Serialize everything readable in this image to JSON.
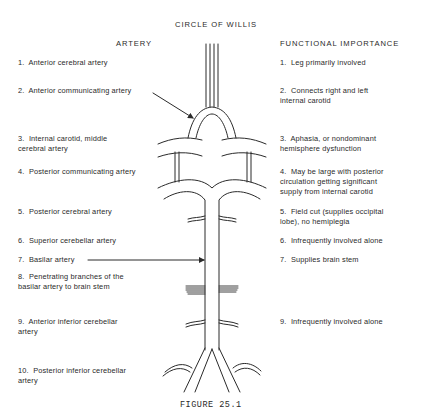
{
  "title": "CIRCLE OF WILLIS",
  "columns": {
    "left": "ARTERY",
    "right": "FUNCTIONAL IMPORTANCE"
  },
  "arteries": [
    {
      "n": "1.",
      "lines": [
        "Anterior cerebral artery"
      ]
    },
    {
      "n": "2.",
      "lines": [
        "Anterior communicating artery"
      ]
    },
    {
      "n": "3.",
      "lines": [
        "Internal carotid, middle",
        "cerebral artery"
      ]
    },
    {
      "n": "4.",
      "lines": [
        "Posterior communicating artery"
      ]
    },
    {
      "n": "5.",
      "lines": [
        "Posterior cerebral artery"
      ]
    },
    {
      "n": "6.",
      "lines": [
        "Superior cerebellar artery"
      ]
    },
    {
      "n": "7.",
      "lines": [
        "Basilar artery"
      ]
    },
    {
      "n": "8.",
      "lines": [
        "Penetrating branches of the",
        "basilar artery to brain stem"
      ]
    },
    {
      "n": "9.",
      "lines": [
        "Anterior inferior cerebellar",
        "artery"
      ]
    },
    {
      "n": "10.",
      "lines": [
        "Posterior inferior cerebellar",
        "artery"
      ]
    }
  ],
  "importance": [
    {
      "n": "1.",
      "lines": [
        "Leg primarily involved"
      ]
    },
    {
      "n": "2.",
      "lines": [
        "Connects right and left",
        "internal carotid"
      ]
    },
    {
      "n": "3.",
      "lines": [
        "Aphasia, or nondominant",
        "hemisphere dysfunction"
      ]
    },
    {
      "n": "4.",
      "lines": [
        "May be large with posterior",
        "circulation getting significant",
        "supply from internal carotid"
      ]
    },
    {
      "n": "5.",
      "lines": [
        "Field cut (supplies occipital",
        "lobe), no hemiplegia"
      ]
    },
    {
      "n": "6.",
      "lines": [
        "Infrequently involved alone"
      ]
    },
    {
      "n": "7.",
      "lines": [
        "Supplies brain stem"
      ]
    },
    {
      "n": "9.",
      "lines": [
        "Infrequently involved alone"
      ]
    }
  ],
  "caption": "FIGURE 25.1",
  "colors": {
    "ink": "#2a2a2a",
    "background": "#ffffff"
  }
}
